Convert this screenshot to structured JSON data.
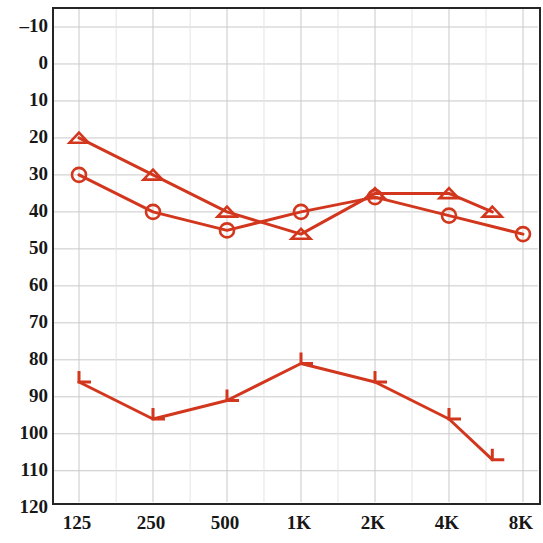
{
  "chart_data": {
    "type": "line",
    "title": "",
    "subtitle": "",
    "xlabel": "",
    "ylabel": "",
    "grid": true,
    "legend_position": "none",
    "accent_color": "#D2371E",
    "frame_color": "#252525",
    "grid_color": "#c9c9c9",
    "minor_grid_color": "#e4e4e4",
    "x_categories": [
      "125",
      "250",
      "500",
      "1K",
      "2K",
      "4K",
      "8K"
    ],
    "x_tick_positions_hz": [
      125,
      250,
      500,
      1000,
      2000,
      4000,
      8000
    ],
    "ylim": [
      -10,
      120
    ],
    "y_ticks": [
      "-10",
      "0",
      "10",
      "20",
      "30",
      "40",
      "50",
      "60",
      "70",
      "80",
      "90",
      "100",
      "110",
      "120"
    ],
    "y_tick_values": [
      -10,
      0,
      10,
      20,
      30,
      40,
      50,
      60,
      70,
      80,
      90,
      100,
      110,
      120
    ],
    "series": [
      {
        "name": "air-conduction-left-triangle",
        "marker": "triangle",
        "color": "#D2371E",
        "x": [
          125,
          250,
          500,
          1000,
          2000,
          4000,
          6000
        ],
        "x_labels": [
          "125",
          "250",
          "500",
          "1K",
          "2K",
          "4K",
          "6K"
        ],
        "values": [
          20,
          30,
          40,
          46,
          35,
          35,
          40
        ]
      },
      {
        "name": "air-conduction-right-circle",
        "marker": "circle",
        "color": "#D2371E",
        "x": [
          125,
          250,
          500,
          1000,
          2000,
          4000,
          8000
        ],
        "x_labels": [
          "125",
          "250",
          "500",
          "1K",
          "2K",
          "4K",
          "8K"
        ],
        "values": [
          30,
          40,
          45,
          40,
          36,
          41,
          46
        ]
      },
      {
        "name": "bone-conduction-masked-bracket",
        "marker": "bracket-l",
        "color": "#D2371E",
        "x": [
          125,
          250,
          500,
          1000,
          2000,
          4000,
          6000
        ],
        "x_labels": [
          "125",
          "250",
          "500",
          "1K",
          "2K",
          "4K",
          "6K"
        ],
        "values": [
          86,
          96,
          91,
          81,
          86,
          96,
          107
        ]
      }
    ]
  }
}
